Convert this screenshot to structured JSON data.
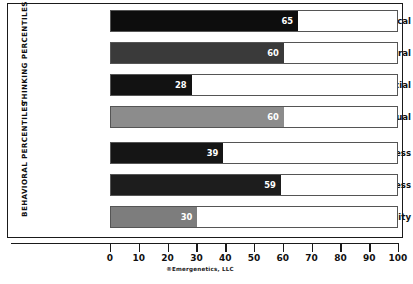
{
  "chart_data": {
    "type": "bar",
    "orientation": "horizontal",
    "title": "",
    "xlabel": "",
    "ylabel": "",
    "xlim": [
      0,
      100
    ],
    "xticks": [
      0,
      10,
      20,
      30,
      40,
      50,
      60,
      70,
      80,
      90,
      100
    ],
    "grid": false,
    "legend": false,
    "attribution": "®Emergenetics, LLC",
    "groups": [
      {
        "name": "THINKING PERCENTILES",
        "categories": [
          "Analytical",
          "Structural",
          "Social",
          "Conceptual"
        ]
      },
      {
        "name": "BEHAVIORAL PERCENTILES",
        "categories": [
          "Expressiveness",
          "Assertiveness",
          "Flexibility"
        ]
      }
    ],
    "categories": [
      "Analytical",
      "Structural",
      "Social",
      "Conceptual",
      "Expressiveness",
      "Assertiveness",
      "Flexibility"
    ],
    "values": [
      65,
      60,
      28,
      60,
      39,
      59,
      30
    ],
    "bars": [
      {
        "label": "Analytical",
        "value": 65,
        "value_text": "65",
        "color": "#0d0d0d",
        "group": "THINKING PERCENTILES"
      },
      {
        "label": "Structural",
        "value": 60,
        "value_text": "60",
        "color": "#3a3a3a",
        "group": "THINKING PERCENTILES"
      },
      {
        "label": "Social",
        "value": 28,
        "value_text": "28",
        "color": "#121212",
        "group": "THINKING PERCENTILES"
      },
      {
        "label": "Conceptual",
        "value": 60,
        "value_text": "60",
        "color": "#8c8c8c",
        "group": "THINKING PERCENTILES"
      },
      {
        "label": "Expressiveness",
        "value": 39,
        "value_text": "39",
        "color": "#151515",
        "group": "BEHAVIORAL PERCENTILES"
      },
      {
        "label": "Assertiveness",
        "value": 59,
        "value_text": "59",
        "color": "#1d1d1d",
        "group": "BEHAVIORAL PERCENTILES"
      },
      {
        "label": "Flexibility",
        "value": 30,
        "value_text": "30",
        "color": "#7d7d7d",
        "group": "BEHAVIORAL PERCENTILES"
      }
    ],
    "colors": {
      "frame": "#1a1a1a",
      "track_border": "#555555",
      "track_fill": "#ffffff",
      "value_text": "#ffffff",
      "label_text": "#111111"
    }
  }
}
